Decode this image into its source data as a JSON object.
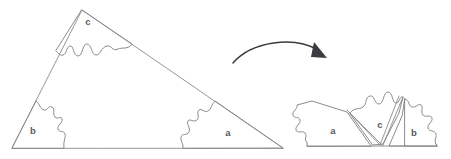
{
  "figure": {
    "background_color": "#ffffff",
    "line_color": "#7e7e82",
    "label_color": "#5a5a5e",
    "arrow_color": "#3b3b40",
    "width": 451,
    "height": 159
  },
  "left_shape": {
    "name": "source-triangle",
    "description": "A scalene triangle cut into three jigsaw pieces",
    "vertices": [
      {
        "x": 12,
        "y": 148
      },
      {
        "x": 82,
        "y": 10
      },
      {
        "x": 283,
        "y": 148
      }
    ],
    "pieces": [
      {
        "id": "c",
        "label": "c",
        "label_x": 88,
        "label_y": 22
      },
      {
        "id": "b",
        "label": "b",
        "label_x": 33,
        "label_y": 131
      },
      {
        "id": "a",
        "label": "a",
        "label_x": 228,
        "label_y": 133
      }
    ]
  },
  "arrow": {
    "name": "transform-arrow",
    "label": "",
    "direction": "right",
    "start": {
      "x": 233,
      "y": 63
    },
    "end": {
      "x": 326,
      "y": 58
    }
  },
  "right_shape": {
    "name": "rearranged-assembly",
    "description": "The same three pieces reassembled along a common baseline",
    "baseline": [
      {
        "x": 307,
        "y": 146
      },
      {
        "x": 437,
        "y": 146
      }
    ],
    "pieces": [
      {
        "id": "a",
        "label": "a",
        "label_x": 333,
        "label_y": 131
      },
      {
        "id": "c",
        "label": "c",
        "label_x": 380,
        "label_y": 125
      },
      {
        "id": "b",
        "label": "b",
        "label_x": 414,
        "label_y": 133
      }
    ]
  }
}
